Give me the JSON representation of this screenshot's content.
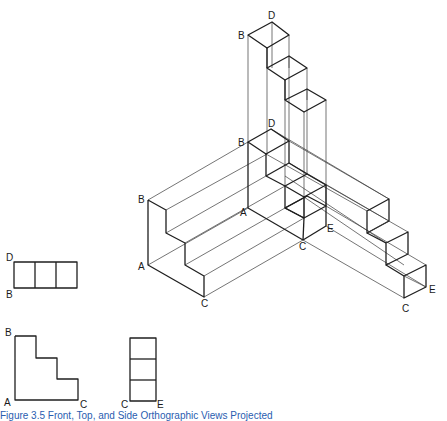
{
  "figure": {
    "iso_labels": {
      "top_B": "B",
      "top_D": "D",
      "mid_B": "B",
      "mid_D": "D",
      "mid_A": "A",
      "mid_C": "C",
      "mid_E": "E",
      "left_B": "B",
      "left_A": "A",
      "left_C": "C",
      "right_C": "C",
      "right_E": "E"
    },
    "top_view": {
      "label_D": "D",
      "label_B": "B"
    },
    "front_view": {
      "label_B": "B",
      "label_A": "A",
      "label_C": "C"
    },
    "side_view": {
      "label_C": "C",
      "label_E": "E"
    },
    "caption": "Figure 3.5   Front, Top, and Side Orthographic Views Projected"
  }
}
